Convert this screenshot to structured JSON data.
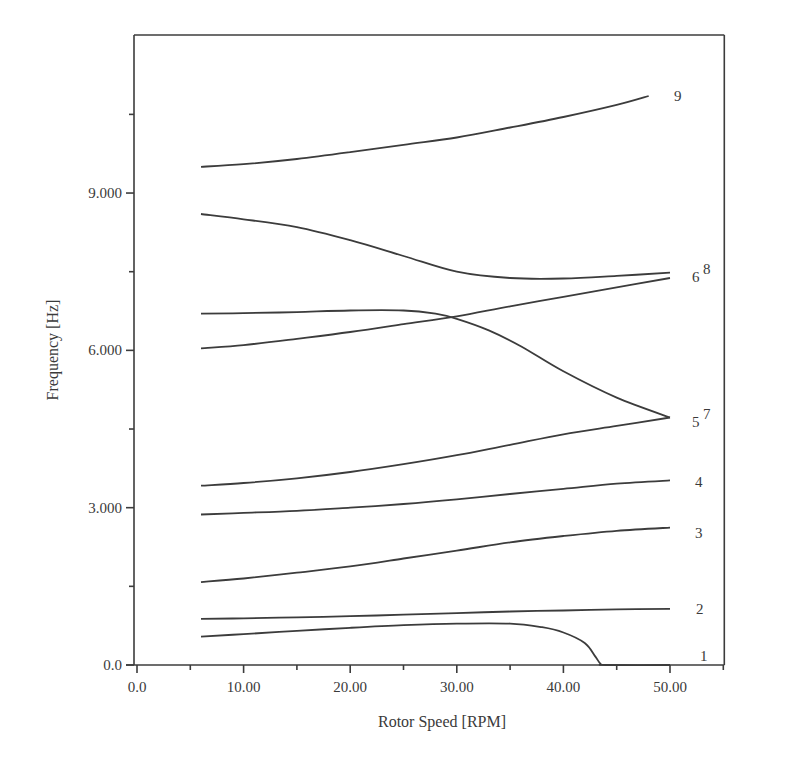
{
  "chart_data": {
    "type": "line",
    "title": "",
    "xlabel": "Rotor Speed [RPM]",
    "ylabel": "Frequency [Hz]",
    "xlim": [
      0,
      55
    ],
    "ylim": [
      0,
      12000
    ],
    "x_ticks": [
      0,
      10,
      20,
      30,
      40,
      50
    ],
    "x_tick_labels": [
      "0.0",
      "10.00",
      "20.00",
      "30.00",
      "40.00",
      "50.00"
    ],
    "x_minor_ticks": [
      5,
      15,
      25,
      35,
      45,
      55
    ],
    "y_ticks": [
      0,
      3000,
      6000,
      9000
    ],
    "y_tick_labels": [
      "0.0",
      "3.000",
      "6.000",
      "9.000"
    ],
    "y_minor_ticks": [
      1500,
      4500,
      7500,
      10500
    ],
    "grid": false,
    "legend": "inline curve labels at right end",
    "x": [
      6,
      10,
      15,
      20,
      25,
      30,
      35,
      40,
      42,
      43,
      43.5,
      44,
      50
    ],
    "series": [
      {
        "name": "1",
        "label": "1",
        "points": [
          [
            6,
            540
          ],
          [
            10,
            590
          ],
          [
            15,
            650
          ],
          [
            20,
            710
          ],
          [
            25,
            760
          ],
          [
            30,
            790
          ],
          [
            35,
            790
          ],
          [
            38,
            720
          ],
          [
            40,
            620
          ],
          [
            42,
            420
          ],
          [
            43,
            160
          ],
          [
            43.5,
            20
          ],
          [
            44,
            0
          ],
          [
            50,
            0
          ]
        ]
      },
      {
        "name": "2",
        "label": "2",
        "points": [
          [
            6,
            880
          ],
          [
            10,
            890
          ],
          [
            15,
            910
          ],
          [
            20,
            930
          ],
          [
            25,
            960
          ],
          [
            30,
            990
          ],
          [
            35,
            1020
          ],
          [
            40,
            1040
          ],
          [
            45,
            1060
          ],
          [
            50,
            1070
          ]
        ]
      },
      {
        "name": "3",
        "label": "3",
        "points": [
          [
            6,
            1580
          ],
          [
            10,
            1650
          ],
          [
            15,
            1760
          ],
          [
            20,
            1880
          ],
          [
            25,
            2030
          ],
          [
            30,
            2180
          ],
          [
            35,
            2340
          ],
          [
            40,
            2460
          ],
          [
            45,
            2560
          ],
          [
            50,
            2620
          ]
        ]
      },
      {
        "name": "4",
        "label": "4",
        "points": [
          [
            6,
            2870
          ],
          [
            10,
            2900
          ],
          [
            15,
            2940
          ],
          [
            20,
            3000
          ],
          [
            25,
            3070
          ],
          [
            30,
            3160
          ],
          [
            35,
            3260
          ],
          [
            40,
            3360
          ],
          [
            45,
            3460
          ],
          [
            50,
            3520
          ]
        ]
      },
      {
        "name": "5",
        "label": "5",
        "points": [
          [
            6,
            3420
          ],
          [
            10,
            3470
          ],
          [
            15,
            3560
          ],
          [
            20,
            3680
          ],
          [
            25,
            3830
          ],
          [
            30,
            4000
          ],
          [
            35,
            4200
          ],
          [
            40,
            4400
          ],
          [
            45,
            4560
          ],
          [
            50,
            4720
          ]
        ]
      },
      {
        "name": "6",
        "label": "6",
        "points": [
          [
            6,
            6040
          ],
          [
            10,
            6100
          ],
          [
            15,
            6220
          ],
          [
            20,
            6350
          ],
          [
            25,
            6500
          ],
          [
            30,
            6650
          ],
          [
            35,
            6840
          ],
          [
            40,
            7020
          ],
          [
            45,
            7200
          ],
          [
            50,
            7380
          ]
        ]
      },
      {
        "name": "7",
        "label": "7",
        "points": [
          [
            6,
            6700
          ],
          [
            10,
            6710
          ],
          [
            15,
            6730
          ],
          [
            20,
            6760
          ],
          [
            25,
            6760
          ],
          [
            28,
            6700
          ],
          [
            30,
            6600
          ],
          [
            33,
            6380
          ],
          [
            36,
            6080
          ],
          [
            40,
            5600
          ],
          [
            45,
            5100
          ],
          [
            50,
            4720
          ]
        ]
      },
      {
        "name": "8",
        "label": "8",
        "points": [
          [
            6,
            8600
          ],
          [
            10,
            8500
          ],
          [
            15,
            8350
          ],
          [
            20,
            8100
          ],
          [
            25,
            7800
          ],
          [
            30,
            7500
          ],
          [
            35,
            7380
          ],
          [
            40,
            7370
          ],
          [
            45,
            7420
          ],
          [
            50,
            7480
          ]
        ]
      },
      {
        "name": "9",
        "label": "9",
        "points": [
          [
            6,
            9500
          ],
          [
            10,
            9550
          ],
          [
            15,
            9650
          ],
          [
            20,
            9780
          ],
          [
            25,
            9920
          ],
          [
            30,
            10060
          ],
          [
            35,
            10250
          ],
          [
            40,
            10450
          ],
          [
            45,
            10680
          ],
          [
            48,
            10850
          ]
        ]
      }
    ]
  },
  "axes": {
    "x_title": "Rotor Speed [RPM]",
    "y_title": "Frequency [Hz]"
  }
}
